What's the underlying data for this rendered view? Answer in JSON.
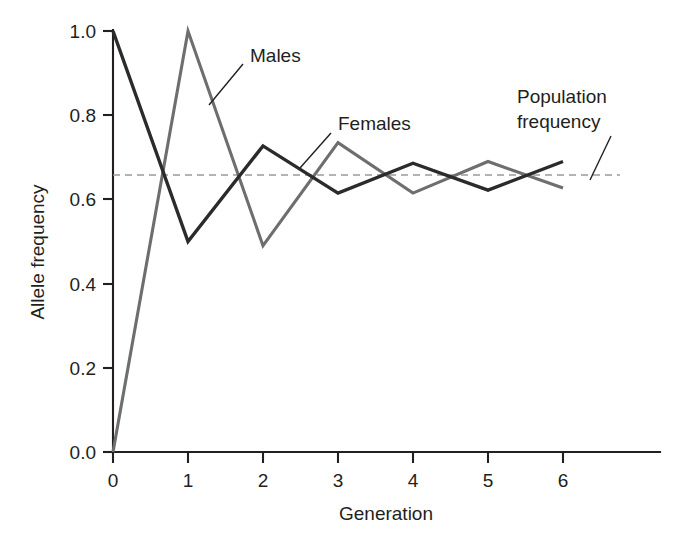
{
  "chart_data": {
    "type": "line",
    "title": "",
    "xlabel": "Generation",
    "ylabel": "Allele frequency",
    "x": [
      0,
      1,
      2,
      3,
      4,
      5,
      6
    ],
    "xlim": [
      0,
      6.6
    ],
    "ylim": [
      0.0,
      1.0
    ],
    "xticks": [
      "0",
      "1",
      "2",
      "3",
      "4",
      "5",
      "6"
    ],
    "yticks": [
      "0.0",
      "0.2",
      "0.4",
      "0.6",
      "0.8",
      "1.0"
    ],
    "ytick_values": [
      0.0,
      0.2,
      0.4,
      0.6,
      0.8,
      1.0
    ],
    "grid": false,
    "legend_position": "inline-annotations",
    "series": [
      {
        "name": "Females",
        "color": "#2b2b2b",
        "values": [
          1.0,
          0.5,
          0.727,
          0.615,
          0.686,
          0.622,
          0.69
        ]
      },
      {
        "name": "Males",
        "color": "#6e6e6e",
        "values": [
          0.0,
          1.0,
          0.49,
          0.735,
          0.615,
          0.69,
          0.627
        ]
      }
    ],
    "reference_line": {
      "name": "Population frequency",
      "value": 0.658,
      "color": "#9a9a9a",
      "style": "dashed"
    },
    "annotations": [
      {
        "label": "Males",
        "target_x": 1.75,
        "target_y": 0.82
      },
      {
        "label": "Females",
        "target_x": 2.75,
        "target_y": 0.695
      },
      {
        "label": "Population frequency",
        "target_x": 5.95,
        "target_y": 0.658
      }
    ]
  },
  "annotations": {
    "males": "Males",
    "females": "Females",
    "population_frequency_line1": "Population",
    "population_frequency_line2": "frequency"
  },
  "axes": {
    "x_title": "Generation",
    "y_title": "Allele frequency"
  }
}
